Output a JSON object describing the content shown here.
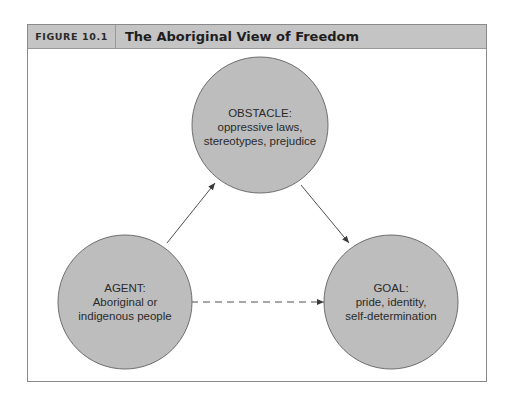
{
  "figure": {
    "label": "FIGURE 10.1",
    "title": "The Aboriginal View of Freedom"
  },
  "nodes": [
    {
      "id": "obstacle",
      "lines": [
        "OBSTACLE:",
        "oppressive laws,",
        "stereotypes, prejudice"
      ]
    },
    {
      "id": "agent",
      "lines": [
        "AGENT:",
        "Aboriginal or",
        "indigenous people"
      ]
    },
    {
      "id": "goal",
      "lines": [
        "GOAL:",
        "pride, identity,",
        "self-determination"
      ]
    }
  ],
  "edges": [
    {
      "from": "agent",
      "to": "obstacle",
      "style": "solid"
    },
    {
      "from": "obstacle",
      "to": "goal",
      "style": "solid"
    },
    {
      "from": "agent",
      "to": "goal",
      "style": "dashed"
    }
  ],
  "colors": {
    "circle_fill": "#bdbdbd",
    "circle_stroke": "#6e6e6e",
    "header_bg": "#c4c4c4",
    "arrow": "#3a3a3a"
  }
}
